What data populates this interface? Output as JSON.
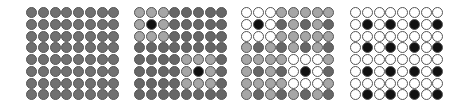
{
  "palette": {
    "G": "#707070",
    "D": "#666666",
    "L": "#a6a6a6",
    "K": "#111111",
    "W": "#ffffff"
  },
  "panels": [
    {
      "name": "panel-uniform-gray",
      "left": 26,
      "rows": [
        "GGGGGGGG",
        "GGGGGGGG",
        "GGGGGGGG",
        "GGGGGGGG",
        "GGGGGGGG",
        "GGGGGGGG",
        "GGGGGGGG",
        "GGGGGGGG"
      ]
    },
    {
      "name": "panel-two-neighborhoods",
      "left": 134,
      "rows": [
        "LLLDDDDD",
        "LKLDDDDD",
        "LLLDDDDD",
        "DDDDDDDD",
        "DDDDLLLD",
        "DDDDLKLD",
        "DDDDLLLD",
        "DDDDDDDD"
      ]
    },
    {
      "name": "panel-checker-with-neighborhoods",
      "left": 241,
      "rows": [
        "WWWLLLLL",
        "WKWDLDLD",
        "WWWLLLLL",
        "LDLDLDLD",
        "LLLLWWWL",
        "LDLDWKWD",
        "LLLLWWWL",
        "LDLDLDLD"
      ]
    },
    {
      "name": "panel-sparse-black-lattice",
      "left": 350,
      "rows": [
        "WWWWWWWW",
        "WKWKWKWK",
        "WWWWWWWW",
        "WKWKWKWK",
        "WWWWWWWW",
        "WKWKWKWK",
        "WWWWWWWW",
        "WKWKWKWK"
      ]
    }
  ]
}
